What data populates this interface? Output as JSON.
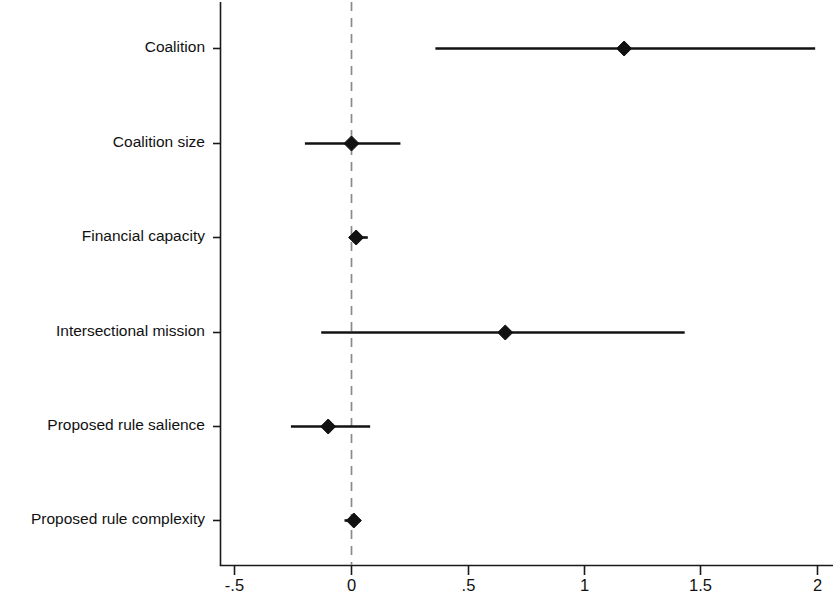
{
  "chart_data": {
    "type": "scatter",
    "subtype": "coefficient-plot",
    "title": "",
    "xlabel": "",
    "ylabel": "",
    "xlim": [
      -0.56,
      2.06
    ],
    "ylim": [
      0,
      7
    ],
    "grid": false,
    "legend": null,
    "reference_line": {
      "value": 0,
      "style": "dashed",
      "color": "#8a8a8a"
    },
    "xticks": [
      -0.5,
      0,
      0.5,
      1,
      1.5,
      2
    ],
    "xticklabels": [
      "-.5",
      "0",
      ".5",
      "1",
      "1.5",
      "2"
    ],
    "categories": [
      "Coalition",
      "Coalition size",
      "Financial capacity",
      "Intersectional mission",
      "Proposed rule salience",
      "Proposed rule complexity"
    ],
    "estimates": [
      1.17,
      0.0,
      0.02,
      0.66,
      -0.1,
      0.01
    ],
    "ci_low": [
      0.36,
      -0.2,
      -0.01,
      -0.13,
      -0.26,
      -0.03
    ],
    "ci_high": [
      1.99,
      0.21,
      0.07,
      1.43,
      0.08,
      0.04
    ],
    "points": [
      {
        "label": "Coalition",
        "estimate": 1.17,
        "ci_low": 0.36,
        "ci_high": 1.99
      },
      {
        "label": "Coalition size",
        "estimate": 0.0,
        "ci_low": -0.2,
        "ci_high": 0.21
      },
      {
        "label": "Financial capacity",
        "estimate": 0.02,
        "ci_low": -0.01,
        "ci_high": 0.07
      },
      {
        "label": "Intersectional mission",
        "estimate": 0.66,
        "ci_low": -0.13,
        "ci_high": 1.43
      },
      {
        "label": "Proposed rule salience",
        "estimate": -0.1,
        "ci_low": -0.26,
        "ci_high": 0.08
      },
      {
        "label": "Proposed rule complexity",
        "estimate": 0.01,
        "ci_low": -0.03,
        "ci_high": 0.04
      }
    ],
    "marker": "diamond",
    "marker_color": "#121212",
    "line_color": "#121212",
    "axis_color": "#1a1a1a",
    "background": "#ffffff"
  },
  "labels": {
    "y0": "Coalition",
    "y1": "Coalition size",
    "y2": "Financial capacity",
    "y3": "Intersectional mission",
    "y4": "Proposed rule salience",
    "y5": "Proposed rule complexity",
    "x0": "-.5",
    "x1": "0",
    "x2": ".5",
    "x3": "1",
    "x4": "1.5",
    "x5": "2"
  }
}
